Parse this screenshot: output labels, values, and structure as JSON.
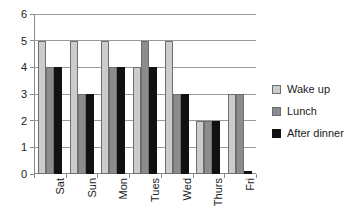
{
  "chart_data": {
    "type": "bar",
    "title": "",
    "subtitle": "",
    "xlabel": "",
    "ylabel": "",
    "categories": [
      "Sat",
      "Sun",
      "Mon",
      "Tues",
      "Wed",
      "Thurs",
      "Fri"
    ],
    "series": [
      {
        "name": "Wake up",
        "color": "#cccccc",
        "values": [
          5,
          5,
          5,
          4,
          5,
          2,
          3
        ]
      },
      {
        "name": "Lunch",
        "color": "#8c8c8c",
        "values": [
          4,
          3,
          4,
          5,
          3,
          2,
          3
        ]
      },
      {
        "name": "After dinner",
        "color": "#111111",
        "values": [
          4,
          3,
          4,
          4,
          3,
          2,
          0.1
        ]
      }
    ],
    "ylim": [
      0,
      6
    ],
    "yticks": [
      0,
      1,
      2,
      3,
      4,
      5,
      6
    ],
    "ytick_labels": [
      "0",
      "1",
      "2",
      "3",
      "4",
      "5",
      "6"
    ],
    "grid": true,
    "grid_axis": "y",
    "legend_position": "right",
    "x_label_rotation": -90
  },
  "legend": {
    "entries": [
      {
        "label": "Wake up",
        "swatch": "legend-swatch-wake-up"
      },
      {
        "label": "Lunch",
        "swatch": "legend-swatch-lunch"
      },
      {
        "label": "After dinner",
        "swatch": "legend-swatch-after-dinner"
      }
    ]
  }
}
